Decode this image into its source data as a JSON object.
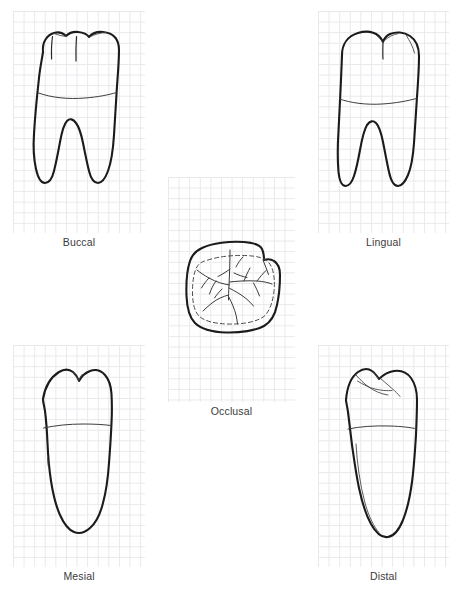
{
  "figure": {
    "background_color": "#ffffff",
    "grid_color": "#e9e9ec",
    "outline_color": "#1b1b1b",
    "caption_color": "#3b3b3b",
    "grid_cell_px": 10.6,
    "width_px": 458,
    "height_px": 592
  },
  "panels": [
    {
      "id": "buccal",
      "label": "Buccal",
      "position": {
        "x": 13,
        "y": 11,
        "w": 132,
        "h": 222
      },
      "caption_y": 236,
      "features": [
        "crown-outline",
        "two-roots",
        "cej-line",
        "buccal-groove",
        "cusp-notches"
      ]
    },
    {
      "id": "lingual",
      "label": "Lingual",
      "position": {
        "x": 318,
        "y": 11,
        "w": 131,
        "h": 222
      },
      "caption_y": 236,
      "features": [
        "crown-outline",
        "two-roots",
        "cej-line",
        "lingual-groove",
        "cusp-notch"
      ]
    },
    {
      "id": "occlusal",
      "label": "Occlusal",
      "position": {
        "x": 168,
        "y": 177,
        "w": 127,
        "h": 225
      },
      "caption_y": 405,
      "features": [
        "rounded-square-outline",
        "dashed-marginal-ridge",
        "central-fissure",
        "developmental-grooves"
      ]
    },
    {
      "id": "mesial",
      "label": "Mesial",
      "position": {
        "x": 13,
        "y": 345,
        "w": 132,
        "h": 222
      },
      "caption_y": 570,
      "features": [
        "crown-outline",
        "single-root-silhouette",
        "cej-line",
        "cusp-notch"
      ]
    },
    {
      "id": "distal",
      "label": "Distal",
      "position": {
        "x": 318,
        "y": 345,
        "w": 131,
        "h": 222
      },
      "caption_y": 570,
      "features": [
        "crown-outline",
        "single-root-silhouette",
        "cej-line",
        "occlusal-ridge-lines"
      ]
    }
  ]
}
